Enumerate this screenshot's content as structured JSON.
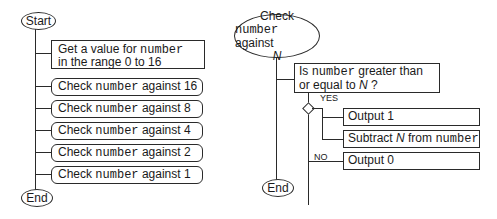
{
  "left_chart": {
    "start_label": "Start",
    "end_label": "End",
    "get_value": {
      "line1_prefix": "Get a value for ",
      "line1_code": "number",
      "line2": "in the range 0 to 16"
    },
    "checks": [
      {
        "prefix": "Check ",
        "code": "number",
        "suffix": " against 16"
      },
      {
        "prefix": "Check ",
        "code": "number",
        "suffix": " against 8"
      },
      {
        "prefix": "Check ",
        "code": "number",
        "suffix": " against 4"
      },
      {
        "prefix": "Check ",
        "code": "number",
        "suffix": " against 2"
      },
      {
        "prefix": "Check ",
        "code": "number",
        "suffix": " against 1"
      }
    ]
  },
  "right_chart": {
    "title_line1": "Check",
    "title_code": "number",
    "title_line2_suffix": " against",
    "title_line3": "N",
    "end_label": "End",
    "condition": {
      "prefix": "Is ",
      "code": "number",
      "suffix": " greater than",
      "line2_prefix": "or equal to ",
      "line2_var": "N",
      "line2_suffix": " ?"
    },
    "yes_label": "YES",
    "no_label": "NO",
    "yes_actions": [
      {
        "text": "Output 1"
      },
      {
        "prefix": "Subtract ",
        "var": "N",
        "middle": " from ",
        "code": "number"
      }
    ],
    "no_actions": [
      {
        "text": "Output 0"
      }
    ]
  }
}
